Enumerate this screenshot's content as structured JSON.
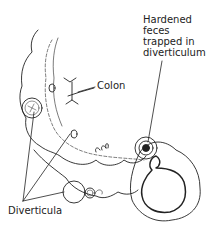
{
  "diagram": {
    "type": "anatomical illustration",
    "labels": {
      "hardened_feces": [
        "Hardened",
        "feces",
        "trapped in",
        "diverticulum"
      ],
      "colon": "Colon",
      "diverticula": "Diverticula"
    },
    "colors": {
      "ink": "#222222",
      "background": "#ffffff"
    }
  }
}
